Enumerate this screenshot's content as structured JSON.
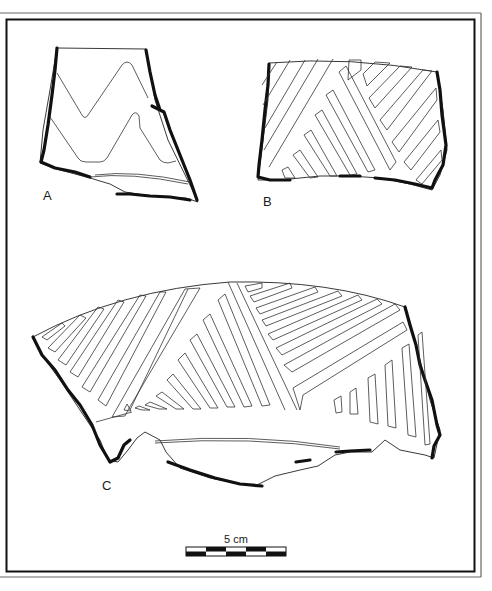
{
  "figure": {
    "type": "archaeological pottery sherd illustration",
    "frame": {
      "outer_color": "#555555",
      "inner_color": "#111111"
    },
    "sherds": [
      {
        "id": "A",
        "label": "A",
        "decoration": "incised double zigzag (chevron) bands"
      },
      {
        "id": "B",
        "label": "B",
        "decoration": "incised diagonal parallel-line panels"
      },
      {
        "id": "C",
        "label": "C",
        "decoration": "incised alternating hatched triangular panels below rim"
      }
    ],
    "scale_bar": {
      "label": "5 cm",
      "segments": 5,
      "colors": {
        "dark": "#111111",
        "light": "#ffffff"
      }
    }
  }
}
